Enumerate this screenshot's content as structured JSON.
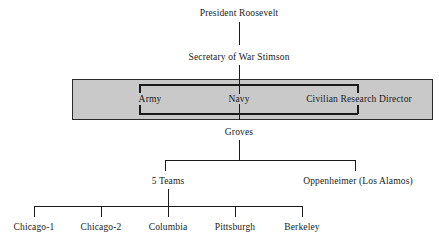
{
  "diagram": {
    "background_color": "#ffffff",
    "line_color": "#1a1a1a",
    "highlight_box_color": "#c9c9c9",
    "nodes": {
      "president": "President Roosevelt",
      "secretary": "Secretary of War Stimson",
      "army": "Army",
      "navy": "Navy",
      "civilian_research_director": "Civilian Research Director",
      "groves": "Groves",
      "five_teams": "5 Teams",
      "oppenheimer": "Oppenheimer (Los Alamos)",
      "team_1": "Chicago-1",
      "team_2": "Chicago-2",
      "team_3": "Columbia",
      "team_4": "Pittsburgh",
      "team_5": "Berkeley"
    }
  }
}
